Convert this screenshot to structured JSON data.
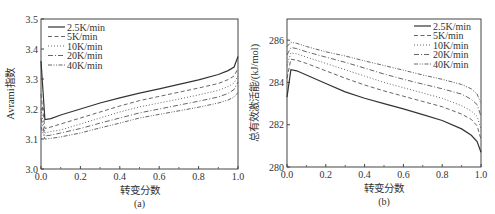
{
  "chart_data": [
    {
      "type": "line",
      "panel_label": "(a)",
      "title": "",
      "xlabel": "转变分数",
      "ylabel": "Avrami指数",
      "xlim": [
        0.0,
        1.0
      ],
      "ylim": [
        3.0,
        3.5
      ],
      "xticks": [
        "0.0",
        "0.2",
        "0.4",
        "0.6",
        "0.8",
        "1.0"
      ],
      "yticks": [
        "3.0",
        "3.1",
        "3.2",
        "3.3",
        "3.4",
        "3.5"
      ],
      "grid": false,
      "legend_position": "upper left",
      "x": [
        0.0,
        0.02,
        0.05,
        0.1,
        0.2,
        0.3,
        0.4,
        0.5,
        0.6,
        0.7,
        0.8,
        0.9,
        0.95,
        0.98,
        1.0
      ],
      "series": [
        {
          "name": "2.5K/min",
          "style": "solid",
          "values": [
            3.36,
            3.165,
            3.168,
            3.18,
            3.2,
            3.22,
            3.237,
            3.253,
            3.267,
            3.282,
            3.297,
            3.315,
            3.328,
            3.34,
            3.375
          ]
        },
        {
          "name": "5K/min",
          "style": "dash",
          "values": [
            3.25,
            3.135,
            3.14,
            3.15,
            3.17,
            3.19,
            3.21,
            3.228,
            3.242,
            3.256,
            3.27,
            3.285,
            3.298,
            3.31,
            3.335
          ]
        },
        {
          "name": "10K/min",
          "style": "dot",
          "values": [
            3.2,
            3.12,
            3.125,
            3.13,
            3.15,
            3.17,
            3.19,
            3.207,
            3.22,
            3.233,
            3.247,
            3.262,
            3.275,
            3.287,
            3.31
          ]
        },
        {
          "name": "20K/min",
          "style": "dashdot",
          "values": [
            3.17,
            3.11,
            3.113,
            3.12,
            3.135,
            3.153,
            3.17,
            3.187,
            3.2,
            3.213,
            3.226,
            3.24,
            3.252,
            3.265,
            3.29
          ]
        },
        {
          "name": "40K/min",
          "style": "dashdotdot",
          "values": [
            3.14,
            3.1,
            3.102,
            3.107,
            3.12,
            3.137,
            3.153,
            3.17,
            3.182,
            3.194,
            3.206,
            3.22,
            3.23,
            3.24,
            3.255
          ]
        }
      ]
    },
    {
      "type": "line",
      "panel_label": "(b)",
      "title": "",
      "xlabel": "转变分数",
      "ylabel": "总有效激活能/(kJ/mol)",
      "xlim": [
        0.0,
        1.0
      ],
      "ylim": [
        280,
        287
      ],
      "xticks": [
        "0.0",
        "0.2",
        "0.4",
        "0.6",
        "0.8",
        "1.0"
      ],
      "yticks": [
        "280",
        "282",
        "284",
        "286"
      ],
      "grid": false,
      "legend_position": "upper right",
      "x": [
        0.0,
        0.02,
        0.05,
        0.1,
        0.2,
        0.3,
        0.4,
        0.5,
        0.6,
        0.7,
        0.8,
        0.9,
        0.95,
        0.98,
        1.0
      ],
      "series": [
        {
          "name": "2.5K/min",
          "style": "solid",
          "values": [
            283.3,
            284.6,
            284.55,
            284.35,
            283.95,
            283.55,
            283.25,
            283.0,
            282.75,
            282.48,
            282.2,
            281.8,
            281.5,
            281.2,
            280.7
          ]
        },
        {
          "name": "5K/min",
          "style": "dash",
          "values": [
            284.2,
            285.1,
            285.05,
            284.9,
            284.55,
            284.2,
            283.88,
            283.6,
            283.35,
            283.1,
            282.85,
            282.5,
            282.25,
            281.95,
            281.3
          ]
        },
        {
          "name": "10K/min",
          "style": "dot",
          "values": [
            284.8,
            285.4,
            285.35,
            285.2,
            284.9,
            284.6,
            284.3,
            284.0,
            283.75,
            283.5,
            283.25,
            282.9,
            282.65,
            282.4,
            281.8
          ]
        },
        {
          "name": "20K/min",
          "style": "dashdot",
          "values": [
            285.3,
            285.65,
            285.6,
            285.45,
            285.2,
            284.95,
            284.68,
            284.4,
            284.15,
            283.92,
            283.7,
            283.45,
            283.2,
            282.95,
            282.4
          ]
        },
        {
          "name": "40K/min",
          "style": "dashdotdot",
          "values": [
            285.7,
            285.9,
            285.85,
            285.7,
            285.45,
            285.25,
            285.02,
            284.8,
            284.58,
            284.35,
            284.15,
            283.9,
            283.7,
            283.45,
            283.0
          ]
        }
      ]
    }
  ]
}
